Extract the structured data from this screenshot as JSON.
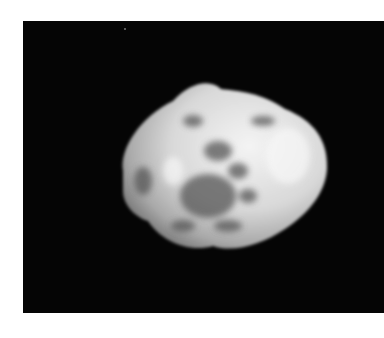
{
  "image": {
    "subject": "irregular rocky moon / asteroid",
    "style": "grayscale photograph",
    "background_color": "#050505",
    "border_color": "#ffffff",
    "object_color": "#e6e6e6",
    "shadow_color": "#6a6a6a"
  }
}
